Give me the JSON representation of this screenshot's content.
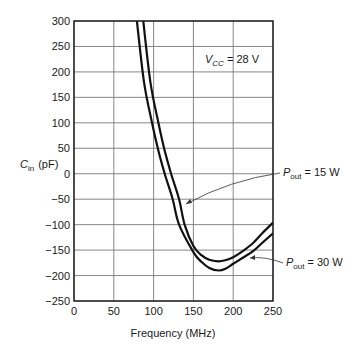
{
  "chart_data": {
    "type": "line",
    "title": "",
    "xlabel": "Frequency (MHz)",
    "ylabel": "C_in (pF)",
    "ylabel_main": "C",
    "ylabel_sub": "in",
    "ylabel_unit": "(pF)",
    "xlim": [
      0,
      250
    ],
    "ylim": [
      -250,
      300
    ],
    "xticks": [
      0,
      50,
      100,
      150,
      200,
      250
    ],
    "yticks": [
      300,
      250,
      200,
      150,
      100,
      50,
      0,
      -50,
      -100,
      -150,
      -200,
      -250
    ],
    "grid": true,
    "annotation": {
      "main": "V",
      "sub": "CC",
      "rest": " = 28 V"
    },
    "series": [
      {
        "name": "P_out = 15 W",
        "label_main": "P",
        "label_sub": "out",
        "label_rest": " = 15 W",
        "x": [
          87,
          96,
          106,
          114,
          122,
          132,
          139,
          150,
          160,
          170,
          181,
          190,
          200,
          212,
          225,
          237,
          250
        ],
        "y": [
          300,
          180,
          100,
          45,
          0,
          -50,
          -100,
          -142,
          -160,
          -169,
          -172,
          -170,
          -164,
          -152,
          -136,
          -116,
          -96
        ]
      },
      {
        "name": "P_out = 30 W",
        "label_main": "P",
        "label_sub": "out",
        "label_rest": " = 30 W",
        "x": [
          79,
          88,
          98,
          106,
          114,
          124,
          132,
          150,
          160,
          170,
          182,
          191,
          200,
          212,
          225,
          237,
          250
        ],
        "y": [
          300,
          180,
          100,
          45,
          0,
          -50,
          -100,
          -154,
          -173,
          -185,
          -190,
          -186,
          -177,
          -165,
          -152,
          -135,
          -117
        ]
      }
    ]
  }
}
